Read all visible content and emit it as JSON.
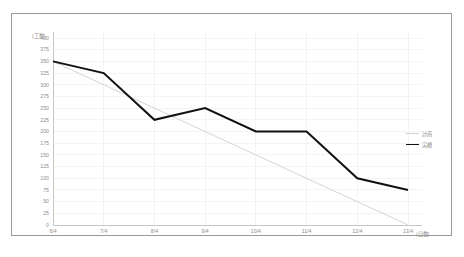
{
  "chart_data": {
    "type": "line",
    "title": "",
    "ylabel": "(工数)",
    "xlabel": "(日数)",
    "categories": [
      "6/4",
      "7/4",
      "8/4",
      "9/4",
      "10/4",
      "11/4",
      "12/4",
      "13/4"
    ],
    "yticks": [
      400,
      375,
      350,
      325,
      300,
      275,
      250,
      225,
      200,
      175,
      150,
      125,
      100,
      75,
      50,
      25,
      0
    ],
    "ylim": [
      0,
      400
    ],
    "grid": true,
    "legend_position": "right",
    "series": [
      {
        "name": "計画",
        "color": "#cfcfcf",
        "values": [
          350,
          300,
          250,
          200,
          150,
          100,
          50,
          0
        ]
      },
      {
        "name": "実績",
        "color": "#111111",
        "values": [
          350,
          325,
          225,
          250,
          200,
          200,
          100,
          75
        ]
      }
    ]
  },
  "legend": {
    "items": [
      {
        "label": "計画",
        "color": "#cfcfcf"
      },
      {
        "label": "実績",
        "color": "#111111"
      }
    ]
  },
  "axes": {
    "y_unit_label": "(工数)",
    "x_unit_label": "(日数)",
    "axis_color": "#b8b8b8",
    "grid_color": "#ececec",
    "tick_text_color": "#8e8e8e"
  }
}
